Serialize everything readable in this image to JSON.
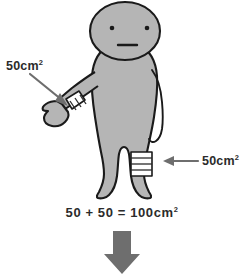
{
  "illustration": {
    "title": "bandaged-figure-area-diagram",
    "subject": "cartoon-person",
    "colors": {
      "background": "#ffffff",
      "body_fill": "#b5b5b5",
      "body_outline": "#1a1a1a",
      "bandage_fill": "#ffffff",
      "bandage_line": "#2b2b2b",
      "annotation_arrow": "#6e6e6e",
      "flow_arrow": "#6e6e6e",
      "text": "#2b2b2b"
    }
  },
  "labels": {
    "left": {
      "value": "50cm",
      "exponent": "2",
      "target": "wrist-bandage"
    },
    "right": {
      "value": "50cm",
      "exponent": "2",
      "target": "leg-bandage"
    }
  },
  "equation": {
    "text": "50 + 50 = 100cm",
    "exponent": "2",
    "terms": [
      50,
      50
    ],
    "total": 100,
    "unit": "cm2"
  },
  "arrows": {
    "left_annotation": {
      "direction": "down-right",
      "points_to": "hand"
    },
    "right_annotation": {
      "direction": "left",
      "points_to": "leg-bandage"
    },
    "flow": {
      "direction": "down",
      "style": "thick-block"
    }
  },
  "face": {
    "left_eye": "dot",
    "right_eye": "dot",
    "mouth": "straight-line"
  },
  "bandages": [
    {
      "name": "wrist-bandage",
      "stripes": 3,
      "orientation": "diagonal"
    },
    {
      "name": "leg-bandage",
      "stripes": 3,
      "orientation": "horizontal"
    }
  ]
}
